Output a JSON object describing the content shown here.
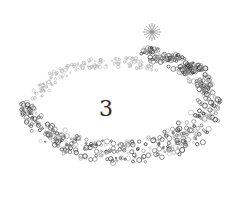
{
  "illustration": {
    "numeral": "3",
    "description": "glitter swirl trail with star burst",
    "colors": {
      "background": "#ffffff",
      "sparkle_dark": "#3a3a3a",
      "sparkle_mid": "#7a7a7a",
      "sparkle_light": "#b5b5b5",
      "numeral": "#2a2a2a"
    }
  }
}
